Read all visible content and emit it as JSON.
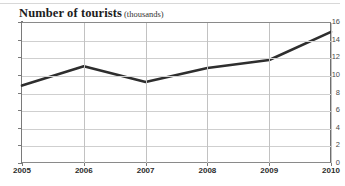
{
  "title": {
    "main": "Number of tourists",
    "units": "(thousands)"
  },
  "chart_data": {
    "type": "line",
    "xlabel": "",
    "ylabel": "Number of tourists (thousands)",
    "categories": [
      "2005",
      "2006",
      "2007",
      "2008",
      "2009",
      "2010"
    ],
    "x": [
      2005,
      2006,
      2007,
      2008,
      2009,
      2010
    ],
    "values": [
      8.9,
      11.1,
      9.3,
      10.9,
      11.8,
      15.0
    ],
    "series": [
      {
        "name": "Number of tourists",
        "values": [
          8.9,
          11.1,
          9.3,
          10.9,
          11.8,
          15.0
        ],
        "color": "#2e2e2e"
      }
    ],
    "ylim": [
      0,
      16
    ],
    "xlim": [
      2005,
      2010
    ],
    "ytick_labels": [
      "0",
      "2",
      "4",
      "6",
      "8",
      "10",
      "12",
      "14",
      "16"
    ],
    "ytick_values": [
      0,
      2,
      4,
      6,
      8,
      10,
      12,
      14,
      16
    ],
    "xtick_labels": [
      "2005",
      "2006",
      "2007",
      "2008",
      "2009",
      "2010"
    ],
    "grid": true,
    "legend": "none"
  },
  "colors": {
    "line": "#2e2e2e",
    "grid": "#cfcfcf",
    "axis": "#7a7a7a",
    "text": "#2b2b2b",
    "background": "#ffffff"
  }
}
